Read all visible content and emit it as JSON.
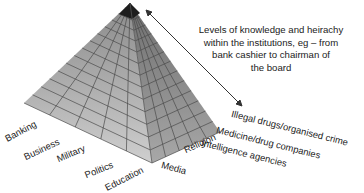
{
  "diagram": {
    "type": "pyramid",
    "caption": "Levels of knowledge and heirachy within the institutions, eg – from bank cashier to chairman of the board",
    "caption_lines": [
      "Levels of knowledge and heirachy",
      "within the institutions, eg – from",
      "bank cashier to chairman of",
      "the board"
    ],
    "left_face_labels": [
      "Banking",
      "Business",
      "Military",
      "Politics",
      "Education"
    ],
    "right_face_labels": [
      "Media",
      "Religion",
      "Intelligence agencies",
      "Medicine/drug companies",
      "Illegal drugs/organised crime"
    ],
    "colors": {
      "left_face": "#bdbdbd",
      "right_face": "#9a9a9a",
      "grid": "#4a4a4a",
      "apex": "#1e1e1e",
      "arrow": "#333333"
    }
  }
}
